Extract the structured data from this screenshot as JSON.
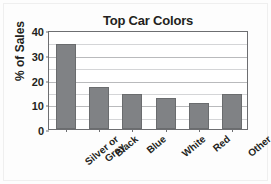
{
  "chart_data": {
    "type": "bar",
    "title": "Top Car Colors",
    "xlabel": "",
    "ylabel": "% of Sales",
    "categories": [
      "Silver or Gray",
      "Black",
      "Blue",
      "White",
      "Red",
      "Other"
    ],
    "category_lines": [
      [
        "Silver or",
        "Gray"
      ],
      [
        "Black"
      ],
      [
        "Blue"
      ],
      [
        "White"
      ],
      [
        "Red"
      ],
      [
        "Other"
      ]
    ],
    "values": [
      34.5,
      17,
      14,
      12.5,
      10.5,
      14
    ],
    "ylim": [
      0,
      40
    ],
    "ytick_labels": [
      "0",
      "10",
      "20",
      "30",
      "40"
    ],
    "ytick_values": [
      0,
      10,
      20,
      30,
      40
    ],
    "gridline_values": [
      5,
      10,
      15,
      20,
      25,
      30,
      35
    ],
    "grid": true,
    "legend": "none",
    "bar_color": "#808285",
    "bar_border_color": "#6a6c6e",
    "axis_color": "#6d6e71",
    "grid_color": "#d4d5d7",
    "text_color": "#231f20",
    "background_color": "#fdfdfd"
  }
}
